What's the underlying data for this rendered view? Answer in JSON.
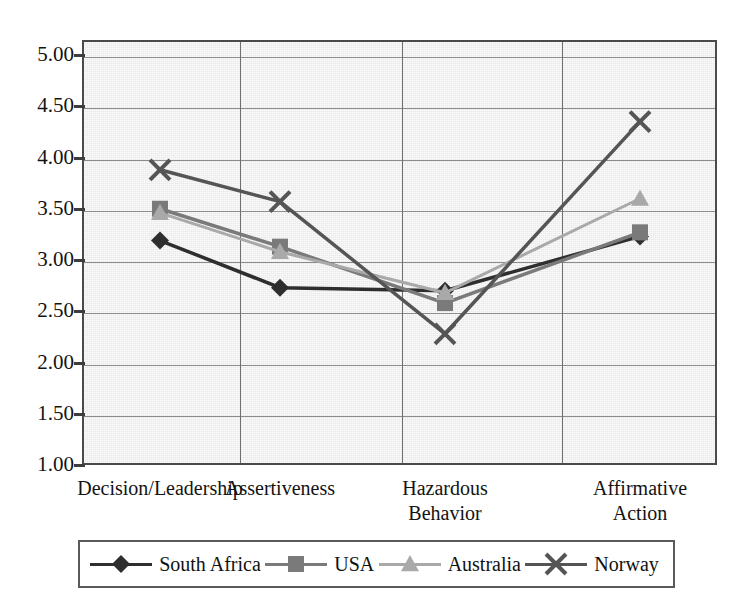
{
  "chart_data": {
    "type": "line",
    "title": "",
    "xlabel": "",
    "ylabel": "",
    "categories": [
      "Decision/Leadership",
      "Assertiveness",
      "Hazardous Behavior",
      "Affirmative Action"
    ],
    "category_lines": [
      [
        "Decision/Leadership"
      ],
      [
        "Assertiveness"
      ],
      [
        "Hazardous",
        "Behavior"
      ],
      [
        "Affirmative",
        "Action"
      ]
    ],
    "ylim": [
      1.0,
      5.0
    ],
    "ytick_step": 0.5,
    "ytick_labels": [
      "5.00",
      "4.50",
      "4.00",
      "3.50",
      "3.00",
      "2.50",
      "2.00",
      "1.50",
      "1.00"
    ],
    "ytick_values": [
      5.0,
      4.5,
      4.0,
      3.5,
      3.0,
      2.5,
      2.0,
      1.5,
      1.0
    ],
    "grid": true,
    "legend_position": "bottom",
    "series": [
      {
        "name": "South Africa",
        "marker": "diamond",
        "color": "#2e2e2e",
        "values": [
          3.19,
          2.73,
          2.7,
          3.23
        ]
      },
      {
        "name": "USA",
        "marker": "square",
        "color": "#7a7a7a",
        "values": [
          3.5,
          3.13,
          2.58,
          3.27
        ]
      },
      {
        "name": "Australia",
        "marker": "triangle",
        "color": "#a9a9a9",
        "values": [
          3.46,
          3.08,
          2.68,
          3.6
        ]
      },
      {
        "name": "Norway",
        "marker": "cross",
        "color": "#555555",
        "values": [
          3.88,
          3.57,
          2.28,
          4.35
        ]
      }
    ]
  },
  "legend": {
    "entries": [
      {
        "label": "South Africa",
        "marker": "diamond-marker",
        "color": "#2e2e2e"
      },
      {
        "label": "USA",
        "marker": "square-marker",
        "color": "#7a7a7a"
      },
      {
        "label": "Australia",
        "marker": "triangle-marker",
        "color": "#a9a9a9"
      },
      {
        "label": "Norway",
        "marker": "cross-marker",
        "color": "#555555"
      }
    ]
  },
  "plot_area": {
    "left": 82,
    "top": 40,
    "width": 635,
    "height": 425,
    "background_color": "#e9e9e9",
    "border_color": "#4a4a4a"
  }
}
